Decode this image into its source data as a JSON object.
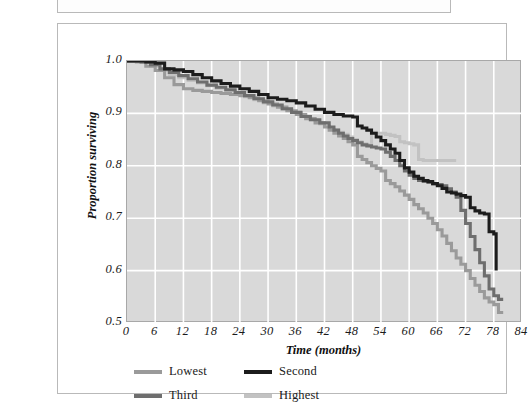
{
  "figure": {
    "caption": ""
  },
  "chart_data": {
    "type": "line",
    "subtype": "kaplan-meier-step",
    "title": "",
    "xlabel": "Time (months)",
    "ylabel": "Proportion surviving",
    "xlim": [
      0,
      84
    ],
    "ylim": [
      0.5,
      1.0
    ],
    "xticks": [
      0,
      6,
      12,
      18,
      24,
      30,
      36,
      42,
      48,
      54,
      60,
      66,
      72,
      78,
      84
    ],
    "yticks": [
      0.5,
      0.6,
      0.7,
      0.8,
      0.9,
      1.0
    ],
    "ytick_labels": [
      "0.5",
      "0.6",
      "0.7",
      "0.8",
      "0.9",
      "1.0"
    ],
    "grid": true,
    "grid_color": "#ffffff",
    "panel_color": "#d9d9d9",
    "legend_position": "below",
    "series": [
      {
        "name": "Lowest",
        "color": "#9a9a9a",
        "points": [
          [
            0,
            1.0
          ],
          [
            2,
            0.998
          ],
          [
            4,
            0.99
          ],
          [
            6,
            0.982
          ],
          [
            8,
            0.968
          ],
          [
            10,
            0.955
          ],
          [
            12,
            0.947
          ],
          [
            14,
            0.944
          ],
          [
            16,
            0.942
          ],
          [
            18,
            0.94
          ],
          [
            20,
            0.938
          ],
          [
            22,
            0.936
          ],
          [
            24,
            0.934
          ],
          [
            26,
            0.93
          ],
          [
            28,
            0.924
          ],
          [
            30,
            0.918
          ],
          [
            32,
            0.912
          ],
          [
            34,
            0.905
          ],
          [
            36,
            0.898
          ],
          [
            38,
            0.89
          ],
          [
            40,
            0.882
          ],
          [
            42,
            0.874
          ],
          [
            43,
            0.868
          ],
          [
            44,
            0.862
          ],
          [
            45,
            0.857
          ],
          [
            46,
            0.852
          ],
          [
            47,
            0.846
          ],
          [
            48,
            0.84
          ],
          [
            49,
            0.818
          ],
          [
            50,
            0.812
          ],
          [
            51,
            0.806
          ],
          [
            52,
            0.8
          ],
          [
            53,
            0.795
          ],
          [
            54,
            0.79
          ],
          [
            55,
            0.772
          ],
          [
            56,
            0.766
          ],
          [
            57,
            0.76
          ],
          [
            58,
            0.752
          ],
          [
            59,
            0.744
          ],
          [
            60,
            0.736
          ],
          [
            61,
            0.726
          ],
          [
            62,
            0.718
          ],
          [
            63,
            0.71
          ],
          [
            64,
            0.7
          ],
          [
            65,
            0.69
          ],
          [
            66,
            0.678
          ],
          [
            67,
            0.666
          ],
          [
            68,
            0.652
          ],
          [
            69,
            0.638
          ],
          [
            70,
            0.624
          ],
          [
            71,
            0.612
          ],
          [
            72,
            0.6
          ],
          [
            73,
            0.585
          ],
          [
            74,
            0.572
          ],
          [
            75,
            0.56
          ],
          [
            76,
            0.548
          ],
          [
            77,
            0.54
          ],
          [
            78,
            0.535
          ],
          [
            79,
            0.52
          ],
          [
            80,
            0.52
          ]
        ]
      },
      {
        "name": "Second",
        "color": "#1c1c1c",
        "points": [
          [
            0,
            1.0
          ],
          [
            4,
            0.998
          ],
          [
            6,
            0.996
          ],
          [
            8,
            0.985
          ],
          [
            10,
            0.983
          ],
          [
            12,
            0.98
          ],
          [
            14,
            0.974
          ],
          [
            16,
            0.968
          ],
          [
            18,
            0.962
          ],
          [
            20,
            0.957
          ],
          [
            22,
            0.952
          ],
          [
            24,
            0.947
          ],
          [
            26,
            0.942
          ],
          [
            28,
            0.936
          ],
          [
            30,
            0.93
          ],
          [
            32,
            0.927
          ],
          [
            34,
            0.924
          ],
          [
            36,
            0.92
          ],
          [
            38,
            0.914
          ],
          [
            40,
            0.908
          ],
          [
            42,
            0.902
          ],
          [
            44,
            0.898
          ],
          [
            46,
            0.895
          ],
          [
            48,
            0.893
          ],
          [
            49,
            0.876
          ],
          [
            50,
            0.872
          ],
          [
            51,
            0.868
          ],
          [
            52,
            0.862
          ],
          [
            53,
            0.855
          ],
          [
            54,
            0.848
          ],
          [
            55,
            0.84
          ],
          [
            56,
            0.832
          ],
          [
            57,
            0.824
          ],
          [
            58,
            0.81
          ],
          [
            59,
            0.796
          ],
          [
            60,
            0.788
          ],
          [
            61,
            0.78
          ],
          [
            62,
            0.776
          ],
          [
            63,
            0.772
          ],
          [
            64,
            0.77
          ],
          [
            65,
            0.766
          ],
          [
            66,
            0.762
          ],
          [
            67,
            0.757
          ],
          [
            68,
            0.75
          ],
          [
            69,
            0.748
          ],
          [
            70,
            0.746
          ],
          [
            71,
            0.743
          ],
          [
            72,
            0.74
          ],
          [
            73,
            0.72
          ],
          [
            74,
            0.714
          ],
          [
            75,
            0.71
          ],
          [
            76,
            0.708
          ],
          [
            77,
            0.674
          ],
          [
            78,
            0.67
          ],
          [
            78.5,
            0.6
          ]
        ]
      },
      {
        "name": "Third",
        "color": "#6e6e6e",
        "points": [
          [
            0,
            1.0
          ],
          [
            3,
            0.998
          ],
          [
            5,
            0.993
          ],
          [
            7,
            0.985
          ],
          [
            9,
            0.978
          ],
          [
            11,
            0.972
          ],
          [
            13,
            0.966
          ],
          [
            15,
            0.96
          ],
          [
            17,
            0.954
          ],
          [
            19,
            0.95
          ],
          [
            21,
            0.945
          ],
          [
            23,
            0.94
          ],
          [
            25,
            0.934
          ],
          [
            27,
            0.928
          ],
          [
            29,
            0.922
          ],
          [
            31,
            0.916
          ],
          [
            33,
            0.909
          ],
          [
            35,
            0.902
          ],
          [
            37,
            0.894
          ],
          [
            39,
            0.888
          ],
          [
            41,
            0.882
          ],
          [
            43,
            0.874
          ],
          [
            44,
            0.868
          ],
          [
            45,
            0.862
          ],
          [
            46,
            0.857
          ],
          [
            47,
            0.852
          ],
          [
            48,
            0.848
          ],
          [
            49,
            0.844
          ],
          [
            50,
            0.84
          ],
          [
            51,
            0.838
          ],
          [
            52,
            0.836
          ],
          [
            53,
            0.834
          ],
          [
            54,
            0.832
          ],
          [
            55,
            0.826
          ],
          [
            56,
            0.818
          ],
          [
            57,
            0.81
          ],
          [
            58,
            0.8
          ],
          [
            59,
            0.79
          ],
          [
            60,
            0.782
          ],
          [
            61,
            0.776
          ],
          [
            62,
            0.772
          ],
          [
            63,
            0.77
          ],
          [
            64,
            0.768
          ],
          [
            65,
            0.766
          ],
          [
            66,
            0.764
          ],
          [
            67,
            0.762
          ],
          [
            68,
            0.756
          ],
          [
            69,
            0.75
          ],
          [
            70,
            0.74
          ],
          [
            71,
            0.715
          ],
          [
            72,
            0.69
          ],
          [
            73,
            0.665
          ],
          [
            74,
            0.64
          ],
          [
            75,
            0.615
          ],
          [
            76,
            0.59
          ],
          [
            77,
            0.565
          ],
          [
            78,
            0.552
          ],
          [
            79,
            0.545
          ],
          [
            80,
            0.545
          ]
        ]
      },
      {
        "name": "Highest",
        "color": "#c2c2c2",
        "points": [
          [
            0,
            1.0
          ],
          [
            3,
            0.997
          ],
          [
            5,
            0.99
          ],
          [
            7,
            0.982
          ],
          [
            9,
            0.974
          ],
          [
            11,
            0.968
          ],
          [
            13,
            0.963
          ],
          [
            15,
            0.958
          ],
          [
            17,
            0.953
          ],
          [
            19,
            0.948
          ],
          [
            21,
            0.943
          ],
          [
            23,
            0.938
          ],
          [
            25,
            0.932
          ],
          [
            27,
            0.926
          ],
          [
            29,
            0.92
          ],
          [
            31,
            0.914
          ],
          [
            33,
            0.908
          ],
          [
            35,
            0.902
          ],
          [
            37,
            0.896
          ],
          [
            38,
            0.894
          ],
          [
            39,
            0.888
          ],
          [
            40,
            0.886
          ],
          [
            41,
            0.88
          ],
          [
            42,
            0.876
          ],
          [
            43,
            0.872
          ],
          [
            44,
            0.868
          ],
          [
            45,
            0.864
          ],
          [
            46,
            0.86
          ],
          [
            47,
            0.855
          ],
          [
            48,
            0.85
          ],
          [
            49,
            0.846
          ],
          [
            50,
            0.842
          ],
          [
            51,
            0.84
          ],
          [
            52,
            0.864
          ],
          [
            53,
            0.862
          ],
          [
            54,
            0.862
          ],
          [
            55,
            0.86
          ],
          [
            56,
            0.858
          ],
          [
            57,
            0.856
          ],
          [
            58,
            0.846
          ],
          [
            59,
            0.844
          ],
          [
            60,
            0.842
          ],
          [
            61,
            0.84
          ],
          [
            62,
            0.812
          ],
          [
            63,
            0.81
          ],
          [
            65,
            0.81
          ],
          [
            67,
            0.81
          ],
          [
            69,
            0.81
          ],
          [
            70,
            0.81
          ]
        ]
      }
    ]
  },
  "legend": {
    "items": [
      {
        "label": "Lowest",
        "color": "#9a9a9a"
      },
      {
        "label": "Second",
        "color": "#1c1c1c"
      },
      {
        "label": "Third",
        "color": "#6e6e6e"
      },
      {
        "label": "Highest",
        "color": "#c2c2c2"
      }
    ]
  }
}
